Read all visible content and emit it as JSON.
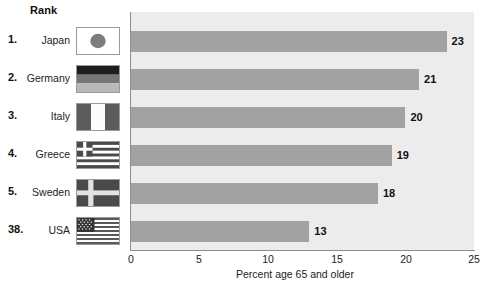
{
  "header": {
    "rank_label": "Rank"
  },
  "axis": {
    "xlabel": "Percent age 65 and older",
    "ticks": [
      "0",
      "5",
      "10",
      "15",
      "20",
      "25"
    ]
  },
  "rows": [
    {
      "rank": "1.",
      "country": "Japan",
      "value": "23",
      "flag": "flag-japan"
    },
    {
      "rank": "2.",
      "country": "Germany",
      "value": "21",
      "flag": "flag-germany"
    },
    {
      "rank": "3.",
      "country": "Italy",
      "value": "20",
      "flag": "flag-italy"
    },
    {
      "rank": "4.",
      "country": "Greece",
      "value": "19",
      "flag": "flag-greece"
    },
    {
      "rank": "5.",
      "country": "Sweden",
      "value": "18",
      "flag": "flag-sweden"
    },
    {
      "rank": "38.",
      "country": "USA",
      "value": "13",
      "flag": "flag-usa"
    }
  ],
  "colors": {
    "bar": "#a2a2a2",
    "plot_background": "#ececec",
    "axis": "#8e8e8e",
    "text": "#111111"
  },
  "chart_data": {
    "type": "bar",
    "orientation": "horizontal",
    "title": "",
    "subtitle": "",
    "categories": [
      "Japan",
      "Germany",
      "Italy",
      "Greece",
      "Sweden",
      "USA"
    ],
    "values": [
      23,
      21,
      20,
      19,
      18,
      13
    ],
    "ranks": [
      "1.",
      "2.",
      "3.",
      "4.",
      "5.",
      "38."
    ],
    "xlabel": "Percent age 65 and older",
    "ylabel": "",
    "xlim": [
      0,
      25
    ],
    "xticks": [
      0,
      5,
      10,
      15,
      20,
      25
    ],
    "grid": false,
    "legend": "none",
    "data_labels": true
  }
}
